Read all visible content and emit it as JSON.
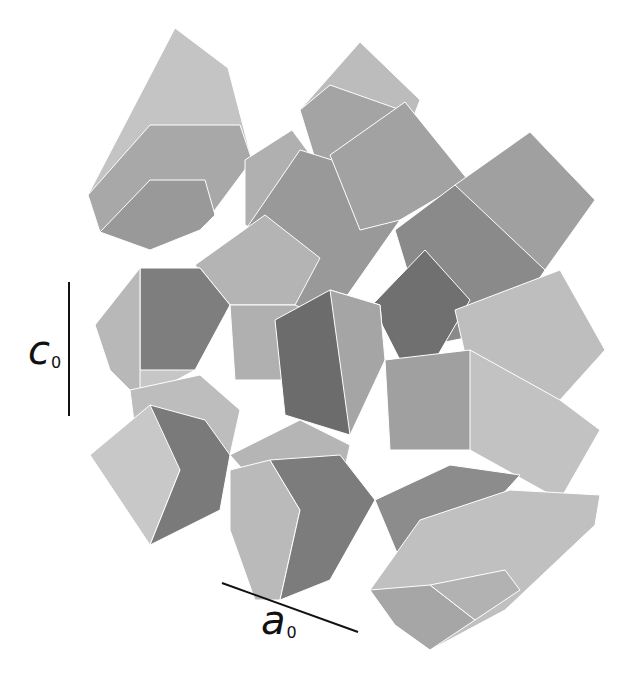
{
  "figure": {
    "background": "#ffffff",
    "palette": {
      "light": "#d6d6d6",
      "mid_light": "#c2c2c2",
      "mid": "#a9a9a9",
      "mid_dark": "#8e8e8e",
      "dark": "#737373",
      "edge_line": "#555555"
    }
  },
  "axes": {
    "c_axis": {
      "label": "c",
      "subscript": "0",
      "line": {
        "x1": 69,
        "y1": 282,
        "x2": 69,
        "y2": 416
      },
      "label_pos": {
        "x": 28,
        "y": 330
      }
    },
    "a_axis": {
      "label": "a",
      "subscript": "0",
      "line": {
        "x1": 222,
        "y1": 583,
        "x2": 358,
        "y2": 632
      },
      "label_pos": {
        "x": 261,
        "y": 600
      }
    }
  },
  "polygons": [
    {
      "pts": "88,195 175,28 228,68 252,160 200,230 150,250 100,232",
      "fill": "#c4c4c4"
    },
    {
      "pts": "88,195 150,125 240,125 252,160 200,230 150,250 100,232",
      "fill": "#a8a8a8"
    },
    {
      "pts": "100,232 150,180 205,180 215,215 200,230 150,250",
      "fill": "#999999"
    },
    {
      "pts": "300,110 360,42 420,100 395,165 320,175",
      "fill": "#bcbcbc"
    },
    {
      "pts": "300,110 330,85 415,115 395,165 320,175",
      "fill": "#a4a4a4"
    },
    {
      "pts": "245,160 292,130 340,195 308,255 245,225",
      "fill": "#b0b0b0"
    },
    {
      "pts": "230,240 290,200 360,250 330,320 260,300",
      "fill": "#8f8f8f"
    },
    {
      "pts": "235,245 300,150 380,175 400,220 330,320 275,300",
      "fill": "#999999"
    },
    {
      "pts": "330,155 405,102 468,180 400,220 360,230",
      "fill": "#a2a2a2"
    },
    {
      "pts": "455,185 530,132 595,200 545,270 490,260",
      "fill": "#a0a0a0"
    },
    {
      "pts": "395,230 455,185 545,270 505,330 430,345",
      "fill": "#8a8a8a"
    },
    {
      "pts": "372,305 425,250 470,300 435,360 400,360",
      "fill": "#707070"
    },
    {
      "pts": "455,310 560,270 605,350 560,400 480,420",
      "fill": "#bebebe"
    },
    {
      "pts": "195,265 265,215 320,258 295,305 230,305",
      "fill": "#b4b4b4"
    },
    {
      "pts": "95,325 140,268 200,268 230,305 195,370 140,400",
      "fill": "#c6c6c6"
    },
    {
      "pts": "140,268 200,268 230,305 195,370 140,370",
      "fill": "#7e7e7e"
    },
    {
      "pts": "95,325 140,268 140,370 140,400 110,370",
      "fill": "#b8b8b8"
    },
    {
      "pts": "230,305 295,305 330,320 300,380 235,380",
      "fill": "#b0b0b0"
    },
    {
      "pts": "275,320 330,290 380,305 385,360 350,435 285,415",
      "fill": "#6c6c6c"
    },
    {
      "pts": "330,290 380,305 385,360 350,435",
      "fill": "#a5a5a5"
    },
    {
      "pts": "385,360 470,350 510,385 470,450 390,450",
      "fill": "#a0a0a0"
    },
    {
      "pts": "470,350 560,400 600,430 560,500 470,450",
      "fill": "#c2c2c2"
    },
    {
      "pts": "130,390 200,375 240,410 230,455 180,470 135,430",
      "fill": "#bdbdbd"
    },
    {
      "pts": "90,455 150,405 175,420 180,470 150,545",
      "fill": "#c8c8c8"
    },
    {
      "pts": "150,405 205,420 230,455 220,510 150,545 180,470",
      "fill": "#7a7a7a"
    },
    {
      "pts": "230,455 300,420 350,445 340,490 270,500",
      "fill": "#b5b5b5"
    },
    {
      "pts": "230,470 270,460 300,510 280,600 255,600 230,530",
      "fill": "#bababa"
    },
    {
      "pts": "270,460 340,455 375,500 330,580 280,600 300,510",
      "fill": "#7c7c7c"
    },
    {
      "pts": "375,500 450,465 520,475 470,530 400,560",
      "fill": "#8c8c8c"
    },
    {
      "pts": "370,590 420,520 510,490 600,495 595,525 505,610 430,650",
      "fill": "#c0c0c0"
    },
    {
      "pts": "370,590 430,585 475,620 430,650 395,625",
      "fill": "#a6a6a6"
    },
    {
      "pts": "430,585 505,570 520,590 475,620",
      "fill": "#b2b2b2"
    }
  ]
}
